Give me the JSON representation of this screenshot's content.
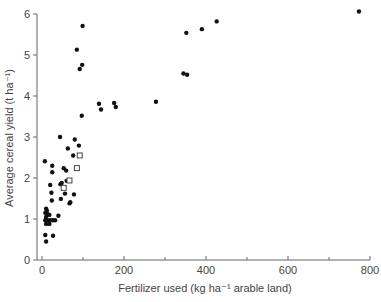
{
  "chart_data": {
    "type": "scatter",
    "title": "",
    "xlabel": "Fertilizer used (kg ha⁻¹ arable land)",
    "ylabel": "Average  cereal yield (t ha⁻¹)",
    "xlim": [
      0,
      800
    ],
    "ylim": [
      0,
      6
    ],
    "xticks": [
      0,
      200,
      400,
      600,
      800
    ],
    "xminor_ticks": [
      100,
      300,
      500,
      700
    ],
    "yticks": [
      0,
      1,
      2,
      3,
      4,
      5,
      6
    ],
    "grid": false,
    "legend": null,
    "series": [
      {
        "name": "filled-circles",
        "marker": "circle-filled",
        "color": "#111111",
        "points": [
          [
            773,
            6.06
          ],
          [
            426,
            5.82
          ],
          [
            390,
            5.63
          ],
          [
            352,
            5.54
          ],
          [
            345,
            4.55
          ],
          [
            354,
            4.52
          ],
          [
            99,
            5.71
          ],
          [
            85,
            5.13
          ],
          [
            98,
            4.76
          ],
          [
            92,
            4.66
          ],
          [
            97,
            3.52
          ],
          [
            139,
            3.81
          ],
          [
            144,
            3.67
          ],
          [
            176,
            3.83
          ],
          [
            180,
            3.73
          ],
          [
            278,
            3.86
          ],
          [
            44,
            3.0
          ],
          [
            80,
            2.94
          ],
          [
            90,
            2.79
          ],
          [
            63,
            2.72
          ],
          [
            76,
            2.55
          ],
          [
            7,
            2.41
          ],
          [
            25,
            2.3
          ],
          [
            53,
            2.24
          ],
          [
            59,
            2.18
          ],
          [
            25,
            2.14
          ],
          [
            60,
            1.93
          ],
          [
            48,
            1.88
          ],
          [
            45,
            1.85
          ],
          [
            20,
            1.83
          ],
          [
            23,
            1.64
          ],
          [
            56,
            1.62
          ],
          [
            78,
            1.6
          ],
          [
            46,
            1.49
          ],
          [
            24,
            1.45
          ],
          [
            69,
            1.41
          ],
          [
            67,
            1.38
          ],
          [
            10,
            1.25
          ],
          [
            12,
            1.2
          ],
          [
            8,
            1.15
          ],
          [
            14,
            1.12
          ],
          [
            18,
            1.1
          ],
          [
            10,
            1.05
          ],
          [
            40,
            1.08
          ],
          [
            8,
            0.97
          ],
          [
            14,
            0.97
          ],
          [
            20,
            0.97
          ],
          [
            26,
            0.97
          ],
          [
            32,
            0.97
          ],
          [
            10,
            0.88
          ],
          [
            18,
            0.88
          ],
          [
            8,
            0.61
          ],
          [
            27,
            0.59
          ],
          [
            10,
            0.45
          ]
        ]
      },
      {
        "name": "open-squares",
        "marker": "square-open",
        "color": "#111111",
        "points": [
          [
            92,
            2.55
          ],
          [
            85,
            2.24
          ],
          [
            67,
            1.94
          ],
          [
            53,
            1.76
          ]
        ]
      }
    ]
  },
  "axes": {
    "x_label": "Fertilizer used (kg ha⁻¹ arable land)",
    "y_label": "Average  cereal yield (t ha⁻¹)"
  }
}
